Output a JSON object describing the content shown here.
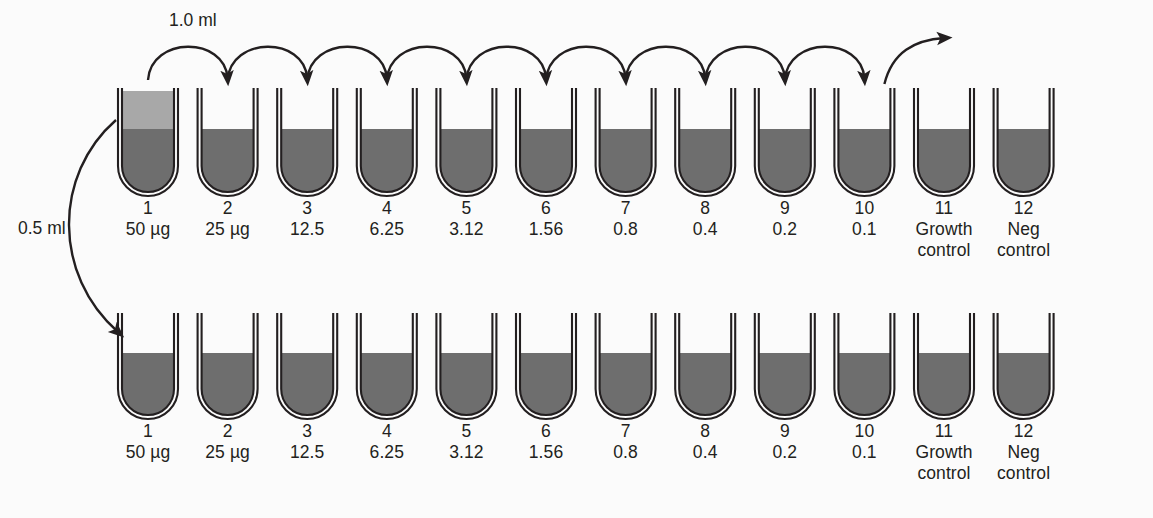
{
  "figure": {
    "background_color": "#fbfbfb",
    "tube_outline_color": "#231f20",
    "broth_fill_color": "#6e6e6e",
    "drug_layer_color": "#a8a8a8",
    "arrow_color": "#231f20"
  },
  "transfer_labels": {
    "row_transfer_volume": "1.0 ml",
    "inoculum_volume": "0.5 ml"
  },
  "rows": [
    {
      "name": "top-row",
      "tubes": [
        {
          "number": "1",
          "concentration": "50 µg",
          "two_tone": true
        },
        {
          "number": "2",
          "concentration": "25 µg",
          "two_tone": false
        },
        {
          "number": "3",
          "concentration": "12.5",
          "two_tone": false
        },
        {
          "number": "4",
          "concentration": "6.25",
          "two_tone": false
        },
        {
          "number": "5",
          "concentration": "3.12",
          "two_tone": false
        },
        {
          "number": "6",
          "concentration": "1.56",
          "two_tone": false
        },
        {
          "number": "7",
          "concentration": "0.8",
          "two_tone": false
        },
        {
          "number": "8",
          "concentration": "0.4",
          "two_tone": false
        },
        {
          "number": "9",
          "concentration": "0.2",
          "two_tone": false
        },
        {
          "number": "10",
          "concentration": "0.1",
          "two_tone": false
        },
        {
          "number": "11",
          "concentration": "Growth\ncontrol",
          "two_tone": false
        },
        {
          "number": "12",
          "concentration": "Neg\ncontrol",
          "two_tone": false
        }
      ]
    },
    {
      "name": "bottom-row",
      "tubes": [
        {
          "number": "1",
          "concentration": "50 µg",
          "two_tone": false
        },
        {
          "number": "2",
          "concentration": "25 µg",
          "two_tone": false
        },
        {
          "number": "3",
          "concentration": "12.5",
          "two_tone": false
        },
        {
          "number": "4",
          "concentration": "6.25",
          "two_tone": false
        },
        {
          "number": "5",
          "concentration": "3.12",
          "two_tone": false
        },
        {
          "number": "6",
          "concentration": "1.56",
          "two_tone": false
        },
        {
          "number": "7",
          "concentration": "0.8",
          "two_tone": false
        },
        {
          "number": "8",
          "concentration": "0.4",
          "two_tone": false
        },
        {
          "number": "9",
          "concentration": "0.2",
          "two_tone": false
        },
        {
          "number": "10",
          "concentration": "0.1",
          "two_tone": false
        },
        {
          "number": "11",
          "concentration": "Growth\ncontrol",
          "two_tone": false
        },
        {
          "number": "12",
          "concentration": "Neg\ncontrol",
          "two_tone": false
        }
      ]
    }
  ]
}
